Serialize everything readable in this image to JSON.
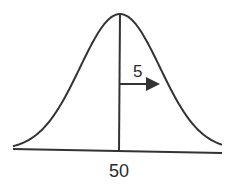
{
  "diagram": {
    "type": "normal-distribution",
    "mean_label": "50",
    "sd_label": "5",
    "mean": 50,
    "sd": 5,
    "stroke_color": "#333333"
  }
}
